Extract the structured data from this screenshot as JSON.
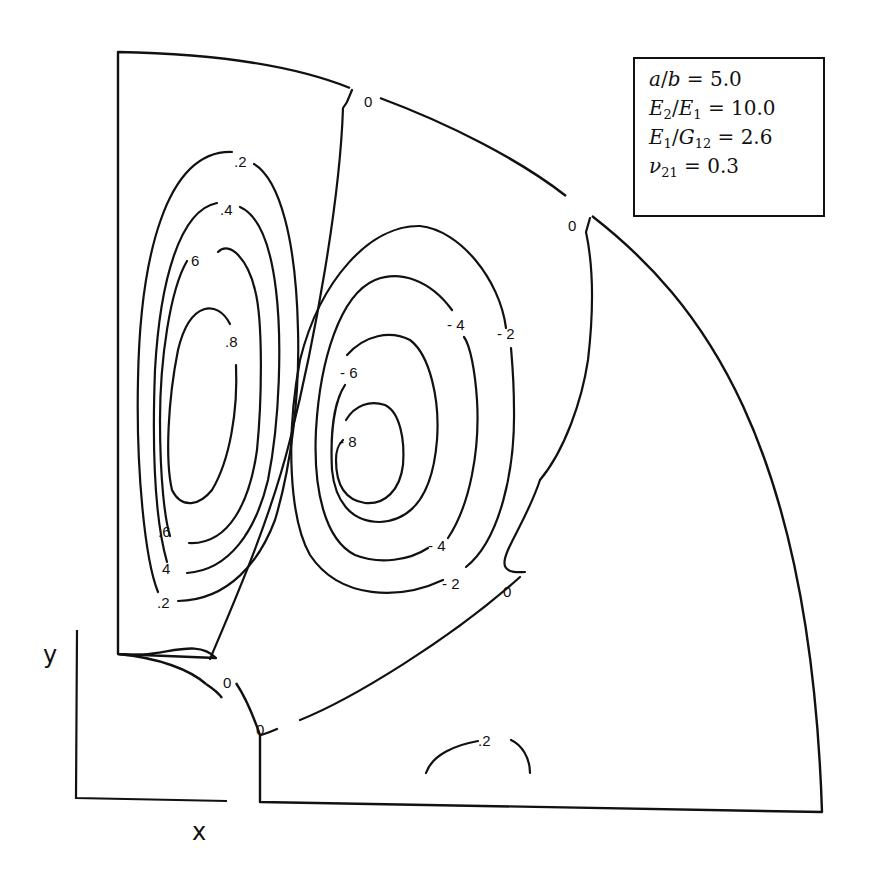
{
  "figure": {
    "type": "contour-plot",
    "axes": {
      "x_label": "x",
      "y_label": "y"
    },
    "parameters": [
      {
        "lhs_html": "a/b",
        "value": "5.0"
      },
      {
        "lhs_html": "E2/E1",
        "value": "10.0"
      },
      {
        "lhs_html": "E1/G12",
        "value": "2.6"
      },
      {
        "lhs_html": "ν21",
        "value": "0.3"
      }
    ],
    "parameter_text": {
      "p0_a": "a",
      "p0_sep": "/",
      "p0_b": "b",
      "p0_eq": " = 5.0",
      "p1_E": "E",
      "p1_s1": "2",
      "p1_sep": "/",
      "p1_E2": "E",
      "p1_s2": "1",
      "p1_eq": " = 10.0",
      "p2_E": "E",
      "p2_s1": "1",
      "p2_sep": "/",
      "p2_G": "G",
      "p2_s2": "12",
      "p2_eq": " = 2.6",
      "p3_nu": "ν",
      "p3_s": "21",
      "p3_eq": " = 0.3"
    },
    "contour_labels": {
      "top_zero_1": "0",
      "top_zero_2": "0",
      "pos_02": ".2",
      "pos_04": ".4",
      "pos_06_top": "6",
      "pos_08": ".8",
      "pos_06_bottom": ".6",
      "pos_04_bottom": "4",
      "pos_02_bottom": ".2",
      "neg_04_top": "- 4",
      "neg_02_top": "- 2",
      "neg_06": "- 6",
      "neg_08": "- 8",
      "neg_04_bottom": "- 4",
      "neg_02_bottom": "- 2",
      "zero_right": "0",
      "zero_hole_arc": "0",
      "zero_hole_lower": "0",
      "pos_02_base": ".2"
    },
    "contour_levels": [
      -0.8,
      -0.6,
      -0.4,
      -0.2,
      0,
      0.2,
      0.4,
      0.6,
      0.8
    ]
  }
}
